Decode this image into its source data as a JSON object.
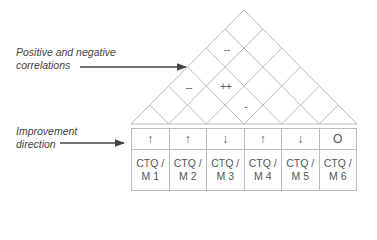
{
  "annotations": {
    "correlations": "Positive and negative correlations",
    "correlations_line1": "Positive and negative",
    "correlations_line2": "correlations",
    "improvement_line1": "Improvement",
    "improvement_line2": "direction"
  },
  "roof": {
    "cells": [
      {
        "symbol": "--",
        "x": 227,
        "y": 49
      },
      {
        "symbol": "--",
        "x": 189,
        "y": 87
      },
      {
        "symbol": "++",
        "x": 226,
        "y": 86
      },
      {
        "symbol": "-",
        "x": 246,
        "y": 106
      }
    ]
  },
  "columns": [
    {
      "direction": "↑",
      "label_line1": "CTQ /",
      "label_line2": "M 1"
    },
    {
      "direction": "↑",
      "label_line1": "CTQ /",
      "label_line2": "M 2"
    },
    {
      "direction": "↓",
      "label_line1": "CTQ /",
      "label_line2": "M 3"
    },
    {
      "direction": "↑",
      "label_line1": "CTQ /",
      "label_line2": "M 4"
    },
    {
      "direction": "↓",
      "label_line1": "CTQ /",
      "label_line2": "M 5"
    },
    {
      "direction": "O",
      "label_line1": "CTQ /",
      "label_line2": "M 6"
    }
  ],
  "colors": {
    "line": "#bbbbbb",
    "arrow": "#444444"
  }
}
